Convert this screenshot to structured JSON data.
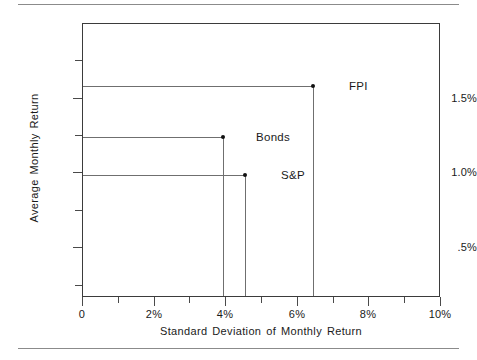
{
  "chart_data": {
    "type": "scatter",
    "title": "",
    "xlabel": "Standard Deviation of Monthly Return",
    "ylabel": "Average Monthly Return",
    "xlim": [
      0,
      10
    ],
    "ylim": [
      0.167,
      2.0
    ],
    "grid": false,
    "legend": "none",
    "x_ticks": [
      {
        "value": 0,
        "label": "0",
        "major": true
      },
      {
        "value": 1,
        "label": "",
        "major": false
      },
      {
        "value": 2,
        "label": "2%",
        "major": true
      },
      {
        "value": 3,
        "label": "",
        "major": false
      },
      {
        "value": 4,
        "label": "4%",
        "major": true
      },
      {
        "value": 5,
        "label": "",
        "major": false
      },
      {
        "value": 6,
        "label": "6%",
        "major": true
      },
      {
        "value": 7,
        "label": "",
        "major": false
      },
      {
        "value": 8,
        "label": "8%",
        "major": true
      },
      {
        "value": 9,
        "label": "",
        "major": false
      },
      {
        "value": 10,
        "label": "10%",
        "major": true
      }
    ],
    "y_ticks": [
      {
        "value": 1.75,
        "label": "",
        "major": false
      },
      {
        "value": 1.5,
        "label": "1.5%",
        "major": true
      },
      {
        "value": 1.25,
        "label": "",
        "major": false
      },
      {
        "value": 1.0,
        "label": "1.0%",
        "major": true
      },
      {
        "value": 0.75,
        "label": "",
        "major": false
      },
      {
        "value": 0.5,
        "label": ".5%",
        "major": true
      },
      {
        "value": 0.25,
        "label": "",
        "major": false
      }
    ],
    "points": [
      {
        "name": "FPI",
        "x": 6.45,
        "y": 1.58,
        "label": "FPI",
        "label_x": 7.45,
        "label_y": 1.58
      },
      {
        "name": "Bonds",
        "x": 3.94,
        "y": 1.24,
        "label": "Bonds",
        "label_x": 4.85,
        "label_y": 1.24
      },
      {
        "name": "S&P",
        "x": 4.55,
        "y": 0.98,
        "label": "S&P",
        "label_x": 5.55,
        "label_y": 0.98
      }
    ],
    "series": [
      {
        "name": "FPI",
        "values": [
          {
            "x": 6.45,
            "y": 1.58
          }
        ]
      },
      {
        "name": "Bonds",
        "values": [
          {
            "x": 3.94,
            "y": 1.24
          }
        ]
      },
      {
        "name": "S&P",
        "values": [
          {
            "x": 4.55,
            "y": 0.98
          }
        ]
      }
    ],
    "annotations": [
      "Leader lines drop from each marker to the x-axis and run left from each marker to the y-axis."
    ]
  },
  "axes": {
    "x_title": "Standard Deviation of Monthly Return",
    "y_title": "Average Monthly Return"
  }
}
